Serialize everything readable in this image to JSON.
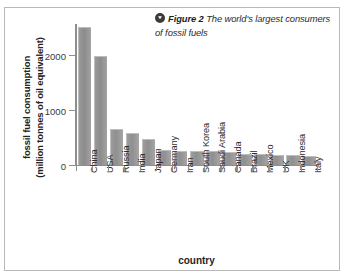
{
  "caption": {
    "icon": "circle-down-triangle-icon",
    "figure_label": "Figure 2",
    "text": "The world's largest consumers of fossil fuels"
  },
  "chart_data": {
    "type": "bar",
    "title": "",
    "xlabel": "country",
    "ylabel": "fossil fuel consumption (million tonnes of oil equivalent)",
    "ylabel_line1": "fossil fuel consumption",
    "ylabel_line2": "(million tonnes of oil equivalent)",
    "ylim": [
      0,
      2600
    ],
    "yticks": [
      0,
      1000,
      2000
    ],
    "ytick_labels": [
      "0",
      "1000",
      "2000"
    ],
    "grid": false,
    "legend": "none",
    "categories": [
      "China",
      "USA",
      "Russia",
      "India",
      "Japan",
      "Germany",
      "Iran",
      "South Korea",
      "Saudi Arabia",
      "Canada",
      "Brazil",
      "Mexico",
      "UK",
      "Indonesia",
      "Italy"
    ],
    "values": [
      2490,
      1960,
      630,
      560,
      460,
      260,
      240,
      240,
      230,
      220,
      175,
      175,
      170,
      165,
      145
    ],
    "bar_color": "#969696"
  }
}
